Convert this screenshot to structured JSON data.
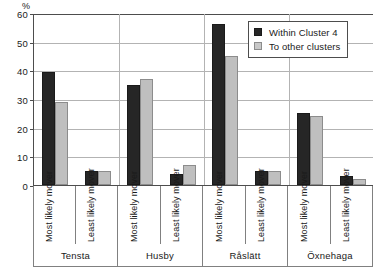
{
  "chart_data": {
    "type": "bar",
    "title": "",
    "xlabel": "",
    "ylabel": "%",
    "ylim": [
      0,
      60
    ],
    "yticks": [
      0,
      10,
      20,
      30,
      40,
      50,
      60
    ],
    "grid": true,
    "legend_position": "top-right",
    "categories": [
      "Most likely mover",
      "Least likely mover",
      "Most likely mover",
      "Least likely mover",
      "Most likely mover",
      "Least likely mover",
      "Most likely mover",
      "Least likely mover"
    ],
    "groups": [
      {
        "name": "Tensta",
        "span": 2
      },
      {
        "name": "Husby",
        "span": 2
      },
      {
        "name": "Råslätt",
        "span": 2
      },
      {
        "name": "Öxnehaga",
        "span": 2
      }
    ],
    "series": [
      {
        "name": "Within Cluster 4",
        "color": "#262626",
        "values": [
          39.5,
          5,
          35,
          4,
          56,
          5,
          25,
          3
        ]
      },
      {
        "name": "To other clusters",
        "color": "#bfbfbf",
        "values": [
          29,
          5,
          37,
          7,
          45,
          5,
          24,
          2
        ]
      }
    ]
  },
  "axis": {
    "unit": "%",
    "tick_labels": [
      "60",
      "50",
      "40",
      "30",
      "20",
      "10",
      "0"
    ]
  },
  "legend": {
    "items": [
      {
        "label": "Within Cluster 4",
        "swatch": "dark"
      },
      {
        "label": "To other clusters",
        "swatch": "light"
      }
    ]
  }
}
